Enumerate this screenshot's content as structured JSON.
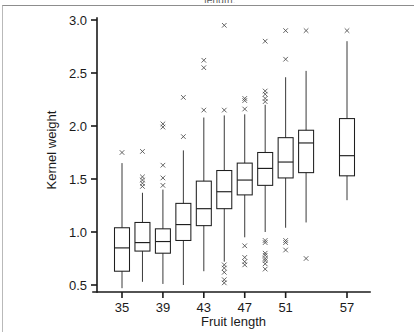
{
  "figure": {
    "clipped_header_text": "length.",
    "background_color": "#ffffff",
    "ink_color": "#1a1a1a"
  },
  "chart_data": {
    "type": "box",
    "title": "",
    "xlabel": "Fruit length",
    "ylabel": "Kernel weight",
    "xlim": [
      33,
      59
    ],
    "ylim": [
      0.38,
      3.05
    ],
    "grid": false,
    "legend": null,
    "ytick_labels": [
      "3.0",
      "2.5",
      "2.0",
      "1.5",
      "1.0",
      "0.5"
    ],
    "ytick_values": [
      3.0,
      2.5,
      2.0,
      1.5,
      1.0,
      0.5
    ],
    "xtick_labels": [
      "35",
      "39",
      "43",
      "47",
      "51",
      "57"
    ],
    "xtick_values": [
      35,
      39,
      43,
      47,
      51,
      57
    ],
    "categories": [
      35,
      37,
      39,
      41,
      43,
      45,
      47,
      49,
      51,
      53,
      55,
      57
    ],
    "boxes": [
      {
        "category": 35,
        "x": 35,
        "whisker_low": 0.47,
        "q1": 0.63,
        "median": 0.85,
        "q3": 1.04,
        "whisker_high": 1.65,
        "outliers": [
          1.75
        ]
      },
      {
        "category": 37,
        "x": 37,
        "whisker_low": 0.53,
        "q1": 0.82,
        "median": 0.9,
        "q3": 1.09,
        "whisker_high": 1.37,
        "outliers": [
          1.43,
          1.46,
          1.49,
          1.52,
          1.76
        ]
      },
      {
        "category": 39,
        "x": 39,
        "whisker_low": 0.51,
        "q1": 0.8,
        "median": 0.91,
        "q3": 1.03,
        "whisker_high": 1.4,
        "outliers": [
          1.44,
          1.51,
          1.63,
          1.99,
          2.02
        ]
      },
      {
        "category": 41,
        "x": 41,
        "whisker_low": 0.5,
        "q1": 0.92,
        "median": 1.07,
        "q3": 1.27,
        "whisker_high": 1.77,
        "outliers": [
          1.9,
          2.27
        ]
      },
      {
        "category": 43,
        "x": 43,
        "whisker_low": 0.63,
        "q1": 1.06,
        "median": 1.22,
        "q3": 1.48,
        "whisker_high": 2.08,
        "outliers": [
          2.15,
          2.55,
          2.62
        ]
      },
      {
        "category": 45,
        "x": 45,
        "whisker_low": 0.72,
        "q1": 1.22,
        "median": 1.38,
        "q3": 1.58,
        "whisker_high": 2.1,
        "outliers": [
          0.52,
          0.55,
          0.62,
          0.66,
          0.69,
          2.15,
          2.95
        ]
      },
      {
        "category": 47,
        "x": 47,
        "whisker_low": 0.95,
        "q1": 1.35,
        "median": 1.49,
        "q3": 1.65,
        "whisker_high": 2.11,
        "outliers": [
          0.69,
          0.72,
          0.76,
          0.87,
          2.16,
          2.24,
          2.26
        ]
      },
      {
        "category": 49,
        "x": 49,
        "whisker_low": 1.0,
        "q1": 1.44,
        "median": 1.6,
        "q3": 1.75,
        "whisker_high": 2.2,
        "outliers": [
          0.65,
          0.7,
          0.73,
          0.75,
          0.78,
          0.8,
          0.9,
          0.92,
          2.23,
          2.26,
          2.3,
          2.33,
          2.8
        ]
      },
      {
        "category": 51,
        "x": 51,
        "whisker_low": 1.04,
        "q1": 1.51,
        "median": 1.66,
        "q3": 1.89,
        "whisker_high": 2.46,
        "outliers": [
          0.83,
          0.9,
          0.92,
          2.63,
          2.9
        ]
      },
      {
        "category": 53,
        "x": 53,
        "whisker_low": 1.09,
        "q1": 1.56,
        "median": 1.84,
        "q3": 1.96,
        "whisker_high": 2.52,
        "outliers": [
          0.75,
          2.9
        ]
      },
      {
        "category": 57,
        "x": 57,
        "whisker_low": 1.3,
        "q1": 1.53,
        "median": 1.72,
        "q3": 2.07,
        "whisker_high": 2.8,
        "outliers": [
          2.9
        ]
      }
    ]
  }
}
